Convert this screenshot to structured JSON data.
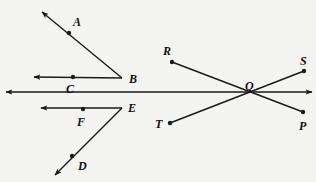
{
  "figure": {
    "background_color": "#f4f4f2",
    "stroke_color": "#1a1a1a",
    "label_color": "#111111",
    "width": 316,
    "height": 182
  },
  "labels": {
    "A": "A",
    "B": "B",
    "C": "C",
    "D": "D",
    "E": "E",
    "F": "F",
    "P": "P",
    "Q": "Q",
    "R": "R",
    "S": "S",
    "T": "T"
  },
  "label_positions": [
    {
      "name": "A",
      "x": 73,
      "y": 16
    },
    {
      "name": "B",
      "x": 129,
      "y": 73
    },
    {
      "name": "C",
      "x": 66,
      "y": 83
    },
    {
      "name": "D",
      "x": 78,
      "y": 160
    },
    {
      "name": "E",
      "x": 128,
      "y": 102
    },
    {
      "name": "F",
      "x": 77,
      "y": 116
    },
    {
      "name": "P",
      "x": 299,
      "y": 120
    },
    {
      "name": "Q",
      "x": 245,
      "y": 80
    },
    {
      "name": "R",
      "x": 163,
      "y": 45
    },
    {
      "name": "S",
      "x": 300,
      "y": 55
    },
    {
      "name": "T",
      "x": 155,
      "y": 118
    }
  ],
  "points": [
    {
      "name": "A",
      "x": 69,
      "y": 33,
      "marked": true
    },
    {
      "name": "B",
      "x": 122,
      "y": 78,
      "marked": false
    },
    {
      "name": "C",
      "x": 73,
      "y": 77,
      "marked": true
    },
    {
      "name": "D",
      "x": 72,
      "y": 156,
      "marked": true
    },
    {
      "name": "E",
      "x": 122,
      "y": 108,
      "marked": false
    },
    {
      "name": "F",
      "x": 83,
      "y": 109,
      "marked": true
    },
    {
      "name": "P",
      "x": 303,
      "y": 112,
      "marked": true
    },
    {
      "name": "Q",
      "x": 248,
      "y": 92,
      "marked": false
    },
    {
      "name": "R",
      "x": 172,
      "y": 62,
      "marked": true
    },
    {
      "name": "S",
      "x": 304,
      "y": 71,
      "marked": true
    },
    {
      "name": "T",
      "x": 170,
      "y": 123,
      "marked": true
    }
  ],
  "segments": [
    {
      "id": "ray-BA",
      "description": "Ray from vertex B through A pointing up-left",
      "from": {
        "x": 122,
        "y": 78
      },
      "to": {
        "x": 42,
        "y": 12
      },
      "arrow_at_end": true,
      "arrow_at_start": false
    },
    {
      "id": "ray-BC",
      "description": "Ray from vertex B through C pointing left",
      "from": {
        "x": 122,
        "y": 78
      },
      "to": {
        "x": 34,
        "y": 77
      },
      "arrow_at_end": true,
      "arrow_at_start": false
    },
    {
      "id": "line-horizontal-main",
      "description": "Long horizontal line through Q with arrows both ends",
      "from": {
        "x": 6,
        "y": 92
      },
      "to": {
        "x": 312,
        "y": 92
      },
      "arrow_at_end": true,
      "arrow_at_start": true
    },
    {
      "id": "ray-EF",
      "description": "Ray from vertex E through F pointing left",
      "from": {
        "x": 122,
        "y": 108
      },
      "to": {
        "x": 41,
        "y": 108
      },
      "arrow_at_end": true,
      "arrow_at_start": false
    },
    {
      "id": "ray-ED",
      "description": "Ray from vertex E through D pointing down-left",
      "from": {
        "x": 122,
        "y": 108
      },
      "to": {
        "x": 55,
        "y": 175
      },
      "arrow_at_end": true,
      "arrow_at_start": false
    },
    {
      "id": "segment-RP",
      "description": "Segment from R down-right through Q to P",
      "from": {
        "x": 172,
        "y": 62
      },
      "to": {
        "x": 303,
        "y": 112
      },
      "arrow_at_end": false,
      "arrow_at_start": false
    },
    {
      "id": "segment-TS",
      "description": "Segment from T up-right through Q to S",
      "from": {
        "x": 170,
        "y": 123
      },
      "to": {
        "x": 304,
        "y": 71
      },
      "arrow_at_end": false,
      "arrow_at_start": false
    }
  ]
}
